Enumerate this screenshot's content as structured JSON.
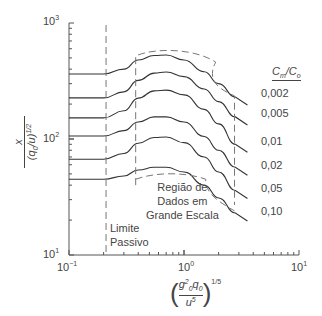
{
  "chart_data": {
    "type": "line",
    "title": "",
    "xlabel": "(g0^2 q0 / u^5)^(1/5)",
    "ylabel": "x / (q0/u)^(1/2)",
    "xscale": "log",
    "yscale": "log",
    "xlim": [
      0.1,
      10
    ],
    "ylim": [
      10,
      1000
    ],
    "x_ticks": [
      "10^-1",
      "10^0",
      "10^1"
    ],
    "y_ticks": [
      "10^1",
      "10^2",
      "10^3"
    ],
    "grid": false,
    "legend_title": "Cm/Co",
    "legend_position": "right",
    "x": [
      0.1,
      0.2,
      0.3,
      0.4,
      0.55,
      0.7,
      1.0,
      1.5,
      2.0,
      2.8
    ],
    "series": [
      {
        "name": "0,002",
        "values": [
          363,
          363,
          400,
          480,
          525,
          530,
          480,
          380,
          300,
          230
        ]
      },
      {
        "name": "0,005",
        "values": [
          226,
          226,
          255,
          320,
          370,
          378,
          345,
          270,
          210,
          155
        ]
      },
      {
        "name": "0,01",
        "values": [
          152,
          152,
          175,
          225,
          260,
          264,
          240,
          180,
          135,
          90
        ]
      },
      {
        "name": "0,02",
        "values": [
          106,
          106,
          118,
          140,
          155,
          155,
          140,
          105,
          80,
          57
        ]
      },
      {
        "name": "0,05",
        "values": [
          67,
          67,
          75,
          92,
          103,
          104,
          93,
          70,
          52,
          36
        ]
      },
      {
        "name": "0,10",
        "values": [
          45,
          45,
          48,
          54,
          57,
          57,
          52,
          40,
          31,
          23
        ]
      }
    ],
    "annotations": [
      {
        "text": "Limite Passivo",
        "type": "vertical-dashed-line",
        "x": 0.21
      },
      {
        "text": "Região de Dados em Grande Escala",
        "type": "dashed-region",
        "x_range": [
          0.38,
          2.75
        ]
      }
    ]
  },
  "axes": {
    "x_ticks": [
      {
        "base": "10",
        "exp": "−1"
      },
      {
        "base": "10",
        "exp": "0"
      },
      {
        "base": "10",
        "exp": "1"
      }
    ],
    "y_ticks": [
      {
        "base": "10",
        "exp": "1"
      },
      {
        "base": "10",
        "exp": "2"
      },
      {
        "base": "10",
        "exp": "3"
      }
    ],
    "ylabel_num": "x",
    "ylabel_den": "(q",
    "ylabel_den_sub": "0",
    "ylabel_den_rest": "/u)",
    "ylabel_den_sup": "1/2",
    "xlabel_num": "g",
    "xlabel_num_sub": "0",
    "xlabel_num_sup": "2",
    "xlabel_num2": "q",
    "xlabel_num2_sub": "0",
    "xlabel_den": "u",
    "xlabel_den_sup": "5",
    "xlabel_power": "1/5"
  },
  "legend": {
    "title_c": "C",
    "title_m": "m",
    "title_slash": "/C",
    "title_o": "o",
    "items": [
      "0,002",
      "0,005",
      "0,01",
      "0,02",
      "0,05",
      "0,10"
    ]
  },
  "annotations": {
    "limite_line1": "Limite",
    "limite_line2": "Passivo",
    "regiao_line1": "Região de",
    "regiao_line2": "Dados em",
    "regiao_line3": "Grande Escala"
  },
  "colors": {
    "curve": "#333333",
    "dashed": "#777777",
    "axis": "#555555"
  }
}
